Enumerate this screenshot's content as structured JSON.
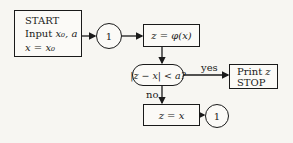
{
  "flowchart": {
    "start_box": {
      "line1": "START",
      "line2_prefix": "Input ",
      "line2_math": "x₀, a",
      "line3_math": "x = x₀"
    },
    "connector_1": {
      "label": "1"
    },
    "iteration_box": {
      "math": "z = φ(x)"
    },
    "decision": {
      "math": "|z − x| < a?"
    },
    "yes_label": "yes",
    "no_label": "no",
    "output_box": {
      "line1_prefix": "Print ",
      "line1_math": "z",
      "line2": "STOP"
    },
    "update_box": {
      "math": "z = x"
    },
    "connector_2": {
      "label": "1"
    }
  }
}
